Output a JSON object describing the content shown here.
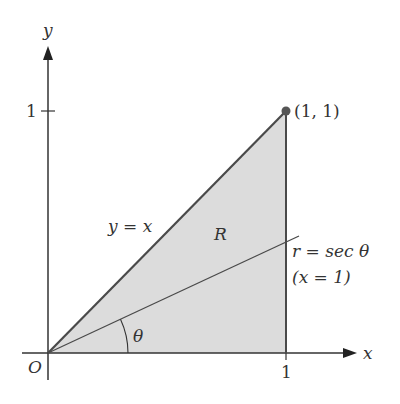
{
  "diagram": {
    "type": "polar-region",
    "axes": {
      "x_label": "x",
      "y_label": "y",
      "origin_label": "O",
      "x_tick_label": "1",
      "y_tick_label": "1"
    },
    "point": {
      "label": "(1, 1)"
    },
    "region_label": "R",
    "line_label": "y = x",
    "ray_label": "r = sec θ",
    "ray_sublabel": "(x = 1)",
    "angle_label": "θ",
    "colors": {
      "fill": "#dcdcdc",
      "stroke": "#4a4a4a",
      "axis": "#333333",
      "point": "#555555"
    }
  }
}
